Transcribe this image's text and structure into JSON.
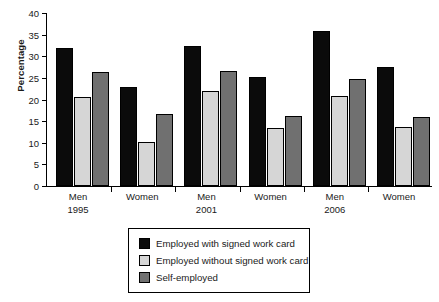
{
  "chart_data": {
    "type": "bar",
    "title": "",
    "subtitle": "",
    "xlabel": "",
    "ylabel": "Percentage",
    "ylim": [
      0,
      40
    ],
    "ytick_step": 5,
    "yticks": [
      0,
      5,
      10,
      15,
      20,
      25,
      30,
      35,
      40
    ],
    "ytick_labels": [
      "0",
      "5",
      "10",
      "15",
      "20",
      "25",
      "30",
      "35",
      "40"
    ],
    "grid": false,
    "legend_position": "bottom-center",
    "categories": [
      "Men",
      "Women",
      "Men",
      "Women",
      "Men",
      "Women"
    ],
    "category_sublabels": [
      "1995",
      "",
      "2001",
      "",
      "2006",
      ""
    ],
    "series": [
      {
        "name": "Employed with signed work card",
        "color": "#0b0b0b",
        "values": [
          31.9,
          22.8,
          32.3,
          25.2,
          35.8,
          27.5
        ]
      },
      {
        "name": "Employed without signed work card",
        "color": "#d6d6d6",
        "values": [
          20.6,
          10.1,
          21.9,
          13.3,
          20.7,
          13.6
        ]
      },
      {
        "name": "Self-employed",
        "color": "#707070",
        "values": [
          26.4,
          16.6,
          26.5,
          16.2,
          24.7,
          16.0
        ]
      }
    ],
    "legend_entries": [
      "Employed with signed work card",
      "Employed without signed work card",
      "Self-employed"
    ]
  },
  "colors": {
    "axis": "#000000",
    "background": "#ffffff",
    "series_1": "#0b0b0b",
    "series_2": "#d6d6d6",
    "series_3": "#707070"
  }
}
